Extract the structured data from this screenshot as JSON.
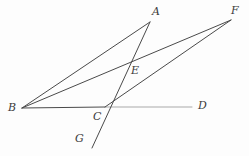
{
  "figure": {
    "background_color": "#fdfdfd",
    "stroke_color": "#4a4a4a",
    "stroke_color_light": "#a9a9a9",
    "label_color": "#3b3b3b",
    "width": 249,
    "height": 156,
    "points": [
      {
        "id": "A",
        "label": "A",
        "x": 150,
        "y": 22,
        "label_x": 152,
        "label_y": 6
      },
      {
        "id": "F",
        "label": "F",
        "x": 231,
        "y": 20,
        "label_x": 231,
        "label_y": 5
      },
      {
        "id": "B",
        "label": "B",
        "x": 22,
        "y": 108,
        "label_x": 8,
        "label_y": 102
      },
      {
        "id": "C",
        "label": "C",
        "x": 105,
        "y": 107,
        "label_x": 93,
        "label_y": 111
      },
      {
        "id": "D",
        "label": "D",
        "x": 192,
        "y": 107,
        "label_x": 198,
        "label_y": 100
      },
      {
        "id": "E",
        "label": "E",
        "x": 128,
        "y": 67,
        "label_x": 131,
        "label_y": 65
      },
      {
        "id": "G",
        "label": "G",
        "x": 92,
        "y": 148,
        "label_x": 75,
        "label_y": 133
      }
    ],
    "segments": [
      {
        "id": "BA",
        "name": "segment-b-a",
        "from": "B",
        "to": "A",
        "x1": 22,
        "y1": 108,
        "x2": 150,
        "y2": 22,
        "color": "#4a4a4a",
        "width": 1
      },
      {
        "id": "BF",
        "name": "segment-b-f",
        "from": "B",
        "to": "F",
        "x1": 22,
        "y1": 108,
        "x2": 231,
        "y2": 20,
        "color": "#4a4a4a",
        "width": 1
      },
      {
        "id": "BC",
        "name": "segment-b-c",
        "from": "B",
        "to": "C",
        "x1": 22,
        "y1": 108,
        "x2": 105,
        "y2": 107,
        "color": "#4a4a4a",
        "width": 1
      },
      {
        "id": "CD",
        "name": "segment-c-d",
        "from": "C",
        "to": "D",
        "x1": 105,
        "y1": 107,
        "x2": 192,
        "y2": 107,
        "color": "#a9a9a9",
        "width": 1
      },
      {
        "id": "CF",
        "name": "segment-c-f",
        "from": "C",
        "to": "F",
        "x1": 105,
        "y1": 107,
        "x2": 231,
        "y2": 20,
        "color": "#4a4a4a",
        "width": 1
      },
      {
        "id": "GA",
        "name": "segment-g-a",
        "from": "G",
        "to": "A",
        "x1": 92,
        "y1": 148,
        "x2": 150,
        "y2": 22,
        "color": "#4a4a4a",
        "width": 1
      }
    ],
    "intersections": [
      {
        "id": "E",
        "of": "BF and GA"
      },
      {
        "id": "C",
        "of": "BD and GA and CF"
      }
    ]
  }
}
